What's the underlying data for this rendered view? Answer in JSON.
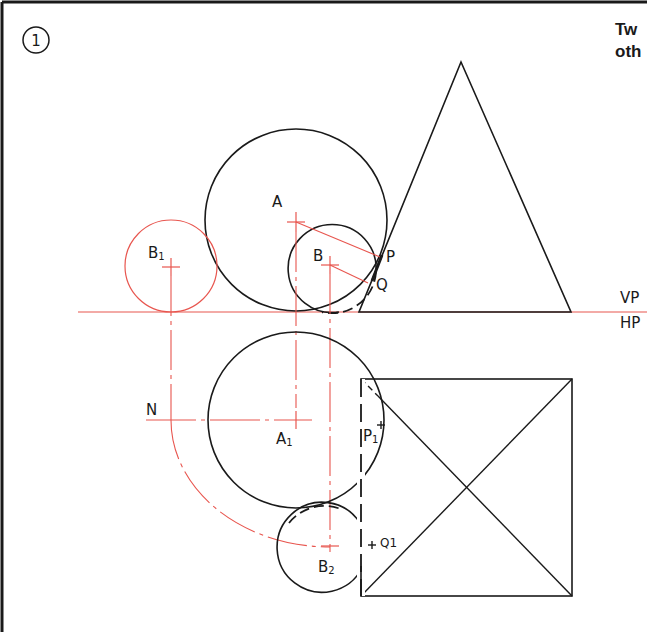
{
  "figure": {
    "number": "1",
    "title_fragment_line1": "Tw",
    "title_fragment_line2": "oth"
  },
  "labels": {
    "vp": "VP",
    "hp": "HP",
    "a": "A",
    "b": "B",
    "b1": "B",
    "b1_sub": "1",
    "p": "P",
    "q": "Q",
    "n": "N",
    "a1": "A",
    "a1_sub": "1",
    "p1": "P",
    "p1_sub": "1",
    "q1": "Q1",
    "b2": "B",
    "b2_sub": "2"
  },
  "colors": {
    "ink": "#1a1a1a",
    "construction": "#e8564f",
    "background": "#ffffff"
  }
}
